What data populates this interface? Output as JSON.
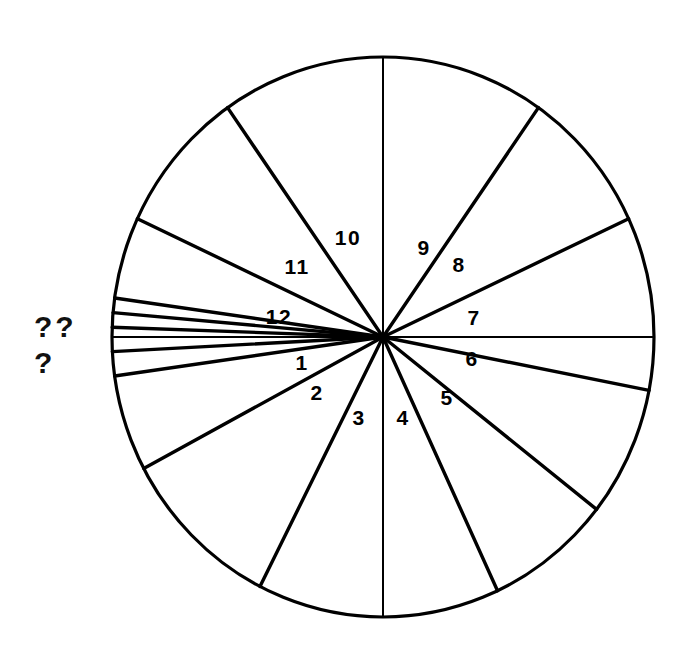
{
  "figure": {
    "type": "pie",
    "background_color": "#ffffff",
    "stroke_color": "#000000",
    "circle": {
      "center_x": 383,
      "center_y": 337,
      "radius_x": 271,
      "radius_y": 280,
      "outline_width": 3.2
    },
    "unknown_markers": [
      {
        "id": "unknown-top",
        "text": "??",
        "x": 34,
        "y": 337
      },
      {
        "id": "unknown-bottom",
        "text": "?",
        "x": 34,
        "y": 373
      }
    ]
  },
  "chart_data": {
    "type": "pie",
    "xlabel": "",
    "ylabel": "",
    "legend": "none",
    "grid": false,
    "units": "degrees",
    "total_degrees": 360,
    "categories": [
      "1",
      "2",
      "3",
      "4",
      "5",
      "6",
      "7",
      "8",
      "9",
      "10",
      "11",
      "12",
      "??",
      "??",
      "??",
      "??",
      "?"
    ],
    "note": "Twelve large numbered sectors plus five very thin unlabeled slivers near the 180 degree direction, marked by the question marks at the left.",
    "sectors": [
      {
        "label": "1",
        "start_deg": -38,
        "end_deg": -11,
        "span_deg": 27,
        "label_x": 302,
        "label_y": 370,
        "labeled": true
      },
      {
        "label": "2",
        "start_deg": -65,
        "end_deg": -38,
        "span_deg": 27,
        "label_x": 317,
        "label_y": 400,
        "labeled": true
      },
      {
        "label": "3",
        "start_deg": -90,
        "end_deg": -65,
        "span_deg": 25,
        "label_x": 359,
        "label_y": 425,
        "labeled": true
      },
      {
        "label": "4",
        "start_deg": -117,
        "end_deg": -90,
        "span_deg": 27,
        "label_x": 403,
        "label_y": 425,
        "labeled": true
      },
      {
        "label": "5",
        "start_deg": -152,
        "end_deg": -117,
        "span_deg": 35,
        "label_x": 447,
        "label_y": 405,
        "labeled": true
      },
      {
        "label": "6",
        "start_deg": -180,
        "end_deg": -152,
        "span_deg": 28,
        "label_x": 472,
        "label_y": 366,
        "labeled": true
      },
      {
        "label": "7",
        "start_deg": 0,
        "end_deg": 25,
        "span_deg": 25,
        "label_x": 474,
        "label_y": 325,
        "labeled": true
      },
      {
        "label": "8",
        "start_deg": 25,
        "end_deg": 55,
        "span_deg": 30,
        "label_x": 459,
        "label_y": 272,
        "labeled": true
      },
      {
        "label": "9",
        "start_deg": 55,
        "end_deg": 90,
        "span_deg": 35,
        "label_x": 424,
        "label_y": 255,
        "labeled": true
      },
      {
        "label": "10",
        "start_deg": 90,
        "end_deg": 125,
        "span_deg": 35,
        "label_x": 348,
        "label_y": 245,
        "labeled": true
      },
      {
        "label": "11",
        "start_deg": 125,
        "end_deg": 155,
        "span_deg": 30,
        "label_x": 297,
        "label_y": 274,
        "labeled": true
      },
      {
        "label": "12",
        "start_deg": 155,
        "end_deg": 172,
        "span_deg": 17,
        "label_x": 279,
        "label_y": 324,
        "labeled": true
      },
      {
        "label": "??",
        "start_deg": 172,
        "end_deg": 175,
        "span_deg": 3,
        "label_x": null,
        "label_y": null,
        "labeled": false
      },
      {
        "label": "??",
        "start_deg": 175,
        "end_deg": 178,
        "span_deg": 3,
        "label_x": null,
        "label_y": null,
        "labeled": false
      },
      {
        "label": "??",
        "start_deg": 178,
        "end_deg": 180,
        "span_deg": 2,
        "label_x": null,
        "label_y": null,
        "labeled": false
      },
      {
        "label": "??",
        "start_deg": 180,
        "end_deg": 183,
        "span_deg": 3,
        "label_x": null,
        "label_y": null,
        "labeled": false
      },
      {
        "label": "?",
        "start_deg": 183,
        "end_deg": 188,
        "span_deg": 5,
        "label_x": null,
        "label_y": null,
        "labeled": false
      }
    ],
    "spoke_angles_deg": [
      0,
      25,
      55,
      90,
      125,
      155,
      172,
      175,
      178,
      180,
      183,
      188,
      242,
      270,
      295,
      322,
      208,
      228
    ],
    "sliver_angles_deg": [
      172,
      175,
      178,
      180,
      183,
      188
    ]
  }
}
